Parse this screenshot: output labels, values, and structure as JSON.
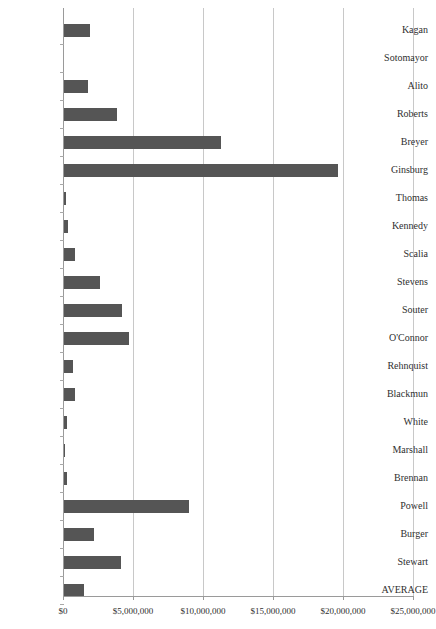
{
  "chart_data": {
    "type": "bar",
    "orientation": "horizontal",
    "title": "",
    "subtitle": "",
    "xlabel": "",
    "ylabel": "",
    "xlim": [
      0,
      25000000
    ],
    "xticks": [
      0,
      5000000,
      10000000,
      15000000,
      20000000,
      25000000
    ],
    "xtick_labels": [
      "$0",
      "$5,000,000",
      "$10,000,000",
      "$15,000,000",
      "$20,000,000",
      "$25,000,000"
    ],
    "grid": true,
    "grid_axis": "x",
    "legend": false,
    "legend_position": "none",
    "bar_color": "#555555",
    "gridline_color": "#c8c8c8",
    "axis_color": "#9a9a9a",
    "categories": [
      "Kagan",
      "Sotomayor",
      "Alito",
      "Roberts",
      "Breyer",
      "Ginsburg",
      "Thomas",
      "Kennedy",
      "Scalia",
      "Stevens",
      "Souter",
      "O'Connor",
      "Rehnquist",
      "Blackmun",
      "White",
      "Marshall",
      "Brennan",
      "Powell",
      "Burger",
      "Stewart",
      "AVERAGE"
    ],
    "values": [
      1850000,
      0,
      1700000,
      3800000,
      11200000,
      19600000,
      150000,
      300000,
      800000,
      2600000,
      4150000,
      4650000,
      650000,
      800000,
      200000,
      40000,
      200000,
      8900000,
      2150000,
      4100000,
      1400000
    ]
  }
}
